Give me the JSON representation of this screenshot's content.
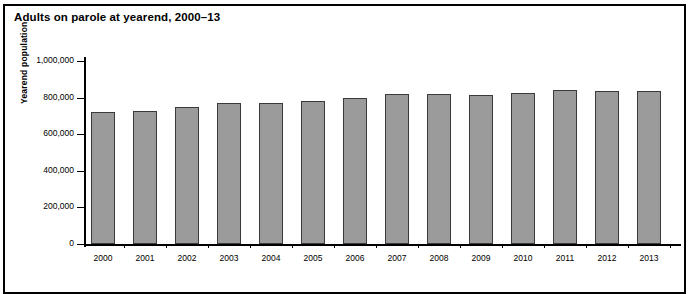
{
  "figure": {
    "title": "Adults on parole at yearend, 2000–13"
  },
  "chart_data": {
    "type": "bar",
    "title": "Adults on parole at yearend, 2000–13",
    "xlabel": "",
    "ylabel": "Yearend population",
    "categories": [
      "2000",
      "2001",
      "2002",
      "2003",
      "2004",
      "2005",
      "2006",
      "2007",
      "2008",
      "2009",
      "2010",
      "2011",
      "2012",
      "2013"
    ],
    "values": [
      723000,
      727000,
      750000,
      769000,
      771000,
      780000,
      799000,
      821000,
      818000,
      813000,
      823000,
      841000,
      838000,
      837000
    ],
    "ylim": [
      0,
      1000000
    ],
    "yticks": [
      0,
      200000,
      400000,
      600000,
      800000,
      1000000
    ],
    "ytick_labels": [
      "0",
      "200,000",
      "400,000",
      "600,000",
      "800,000",
      "1,000,000"
    ],
    "grid": false,
    "legend": "none",
    "bar_color": "#9b9b9b",
    "bar_edge_color": "#3a3a3a"
  }
}
